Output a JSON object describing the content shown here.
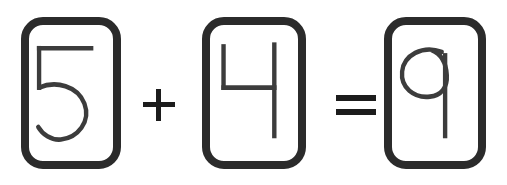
{
  "scene": {
    "title": "Handwritten arithmetic equation",
    "background_color": "#ffffff",
    "expression": "5 + 4 = 9",
    "width": 507,
    "height": 185
  },
  "style": {
    "card_border_color": "#2b2b2b",
    "card_fill_color": "#ffffff",
    "digit_stroke_color": "#3c3c3c",
    "operator_color": "#1c1c1c"
  },
  "cards": [
    {
      "id": "card-first-operand",
      "digit": "5",
      "label": "five",
      "role": "first operand",
      "x": 21,
      "y": 17,
      "width": 100,
      "height": 152
    },
    {
      "id": "card-second-operand",
      "digit": "4",
      "label": "four",
      "role": "second operand",
      "x": 202,
      "y": 17,
      "width": 104,
      "height": 152
    },
    {
      "id": "card-result",
      "digit": "9",
      "label": "nine",
      "role": "result",
      "x": 384,
      "y": 17,
      "width": 102,
      "height": 152
    }
  ],
  "operators": [
    {
      "id": "operator-plus",
      "symbol": "+",
      "name": "plus",
      "x": 140,
      "y": 86
    },
    {
      "id": "operator-equals",
      "symbol": "=",
      "name": "equals",
      "x": 332,
      "y": 92
    }
  ],
  "equation": {
    "left_operand": "5",
    "operator": "+",
    "right_operand": "4",
    "relation": "=",
    "result": "9",
    "full_text": "5 + 4 = 9"
  }
}
